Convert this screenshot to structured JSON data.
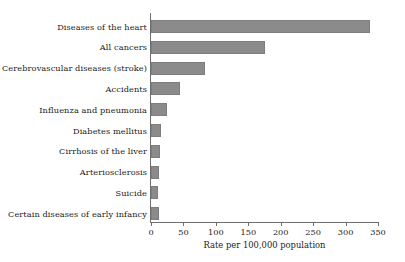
{
  "chart_data": {
    "type": "bar",
    "orientation": "horizontal",
    "title": "",
    "xlabel": "Rate per 100,000 population",
    "ylabel": "",
    "xlim": [
      0,
      350
    ],
    "xticks": [
      0,
      50,
      100,
      150,
      200,
      250,
      300,
      350
    ],
    "grid": false,
    "legend": false,
    "bar_color": "#8b8b8b",
    "categories": [
      "Diseases of the heart",
      "All cancers",
      "Cerebrovascular diseases (stroke)",
      "Accidents",
      "Influenza and pneumonia",
      "Diabetes mellitus",
      "Cirrhosis of the liver",
      "Arteriosclerosis",
      "Suicide",
      "Certain diseases of early infancy"
    ],
    "values": [
      338,
      176,
      83,
      44,
      25,
      15,
      14,
      13,
      11,
      12
    ]
  }
}
